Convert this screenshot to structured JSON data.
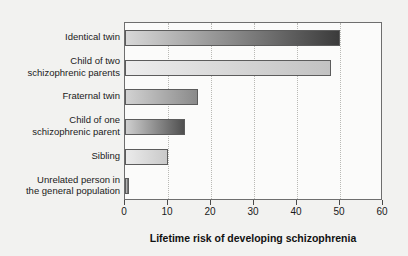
{
  "chart_data": {
    "type": "bar",
    "orientation": "horizontal",
    "title": "",
    "xlabel": "Lifetime risk of developing schizophrenia",
    "ylabel": "",
    "xlim": [
      0,
      60
    ],
    "ylim": null,
    "grid": true,
    "legend": null,
    "xticks": [
      0,
      10,
      20,
      30,
      40,
      50,
      60
    ],
    "xticklabels": [
      "0",
      "10",
      "20",
      "30",
      "40",
      "50",
      "60"
    ],
    "categories": [
      "Identical twin",
      "Child of two\nschizophrenic parents",
      "Fraternal twin",
      "Child of one\nschizophrenic parent",
      "Sibling",
      "Unrelated person in\nthe general population"
    ],
    "values": [
      50,
      48,
      17,
      14,
      10,
      1
    ],
    "bars": [
      {
        "label": "Identical twin",
        "value": 50,
        "color_start": "#d8d8d8",
        "color_end": "#3b3b3b"
      },
      {
        "label": "Child of two schizophrenic parents",
        "value": 48,
        "color_start": "#ededed",
        "color_end": "#c2c2c2"
      },
      {
        "label": "Fraternal twin",
        "value": 17,
        "color_start": "#d2d2d2",
        "color_end": "#8a8a8a"
      },
      {
        "label": "Child of one schizophrenic parent",
        "value": 14,
        "color_start": "#cfcfcf",
        "color_end": "#4f4f4f"
      },
      {
        "label": "Sibling",
        "value": 10,
        "color_start": "#ebebeb",
        "color_end": "#c9c9c9"
      },
      {
        "label": "Unrelated person in the general population",
        "value": 1,
        "color_start": "#cfcfcf",
        "color_end": "#5a5a5a"
      }
    ],
    "colors": {
      "background": "#f2f2f0",
      "plot_background": "#fbfbfa",
      "axis": "#6e6e6e",
      "grid": "#b9b9b5",
      "text": "#1a1a1a"
    }
  }
}
